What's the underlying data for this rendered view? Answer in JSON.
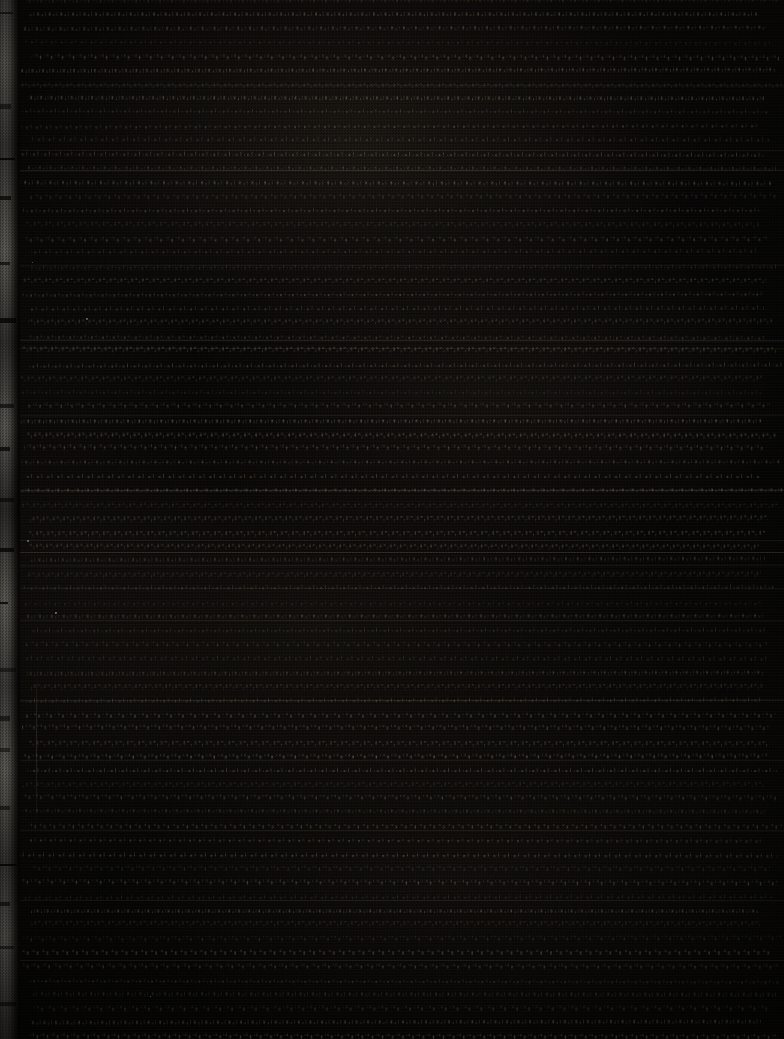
{
  "image": {
    "kind": "scanned-manuscript-page",
    "width": 784,
    "height": 1039,
    "description": "Severely underexposed scan of a dense handwritten manuscript page. Content fills the frame edge to edge with no visible margins or page furniture.",
    "legibility": "no-text-legible",
    "legibility_note": "At maximum zoom no individual characters, words, headings, page numbers or captions resolve above the noise floor; the exposure is too low to transcribe any text."
  },
  "colors": {
    "background": "#0a0908",
    "paper_dark": "#0d0b09",
    "paper_darkest": "#080706",
    "ink_mark": "#221d14",
    "ink_mark_bright": "#332c20",
    "rule_line": "#d6ccb6",
    "page_edge_light": "#8c8980",
    "page_edge_mid": "#6e6b63",
    "page_edge_dark": "#14120f",
    "speck": "#e2dac8"
  },
  "page_edge": {
    "name": "left-page-edge-strip",
    "position": "left",
    "x": 0,
    "width_px_min": 10,
    "width_px_max": 20,
    "description": "Irregular light-gray vertical band running the full height of the frame, brightness and width varying down the page; the lit scanner backing visible past the edge of the sheet.",
    "notches": [
      {
        "y": 12
      },
      {
        "y": 104
      },
      {
        "y": 158
      },
      {
        "y": 196
      },
      {
        "y": 262
      },
      {
        "y": 318
      },
      {
        "y": 404
      },
      {
        "y": 447
      },
      {
        "y": 498
      },
      {
        "y": 548
      },
      {
        "y": 602
      },
      {
        "y": 668
      },
      {
        "y": 716
      },
      {
        "y": 748
      },
      {
        "y": 806
      },
      {
        "y": 864
      },
      {
        "y": 902
      },
      {
        "y": 946
      },
      {
        "y": 1002
      }
    ]
  },
  "crease": {
    "name": "vertical-crease",
    "x": 36,
    "y": 676,
    "height": 150,
    "description": "Faint vertical fold or crease line in the lower-left quadrant."
  },
  "text_block": {
    "name": "manuscript-text-block",
    "left": 18,
    "right": 784,
    "top": 0,
    "bottom": 1039,
    "line_pitch_px": 14,
    "approx_line_count": 70,
    "orientation": "horizontal",
    "full_bleed": true,
    "note": "Rows of faint glyph-like pen marks, only a few levels above the black background, running the full width of the frame."
  },
  "rule_lines": [
    {
      "y": 85,
      "strength": "soft"
    },
    {
      "y": 150,
      "strength": "soft"
    },
    {
      "y": 170,
      "strength": "normal"
    },
    {
      "y": 265,
      "strength": "soft"
    },
    {
      "y": 340,
      "strength": "normal"
    },
    {
      "y": 348,
      "strength": "soft"
    },
    {
      "y": 415,
      "strength": "soft"
    },
    {
      "y": 490,
      "strength": "normal"
    },
    {
      "y": 540,
      "strength": "soft"
    },
    {
      "y": 552,
      "strength": "normal"
    },
    {
      "y": 565,
      "strength": "soft"
    },
    {
      "y": 588,
      "strength": "soft"
    },
    {
      "y": 620,
      "strength": "soft"
    },
    {
      "y": 700,
      "strength": "normal"
    },
    {
      "y": 760,
      "strength": "soft"
    },
    {
      "y": 830,
      "strength": "soft"
    },
    {
      "y": 900,
      "strength": "soft"
    },
    {
      "y": 960,
      "strength": "soft"
    }
  ],
  "specks": [
    {
      "x": 55,
      "y": 612,
      "size": 2
    },
    {
      "x": 27,
      "y": 540,
      "size": 2
    },
    {
      "x": 86,
      "y": 318,
      "size": 2
    },
    {
      "x": 32,
      "y": 262,
      "size": 1
    },
    {
      "x": 150,
      "y": 996,
      "size": 1
    }
  ]
}
